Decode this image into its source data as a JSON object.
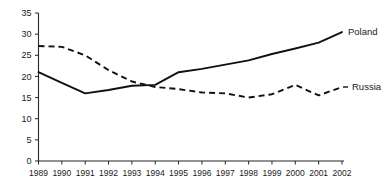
{
  "chart_data": {
    "type": "line",
    "title": "",
    "subtitle": "",
    "xlabel": "",
    "ylabel": "",
    "categories": [
      "1989",
      "1990",
      "1991",
      "1992",
      "1993",
      "1994",
      "1995",
      "1996",
      "1997",
      "1998",
      "1999",
      "2000",
      "2001",
      "2002"
    ],
    "x": [
      1989,
      1990,
      1991,
      1992,
      1993,
      1994,
      1995,
      1996,
      1997,
      1998,
      1999,
      2000,
      2001,
      2002
    ],
    "series": [
      {
        "name": "Poland",
        "style": "solid",
        "values": [
          21.0,
          18.5,
          16.0,
          16.8,
          17.8,
          18.0,
          21.0,
          21.8,
          22.8,
          23.8,
          25.3,
          26.6,
          28.0,
          30.5
        ]
      },
      {
        "name": "Russia",
        "style": "dashed",
        "values": [
          27.2,
          27.0,
          25.0,
          21.5,
          18.8,
          17.5,
          17.0,
          16.2,
          16.0,
          15.0,
          15.8,
          18.0,
          15.5,
          17.5
        ]
      }
    ],
    "ylim": [
      0,
      35
    ],
    "yticks": [
      0,
      5,
      10,
      15,
      20,
      25,
      30,
      35
    ],
    "ytick_labels": [
      "0",
      "5",
      "10",
      "15",
      "20",
      "25",
      "30",
      "35"
    ],
    "xlim": [
      1989,
      2002
    ],
    "grid": false,
    "legend_position": "right-inline",
    "annotations": [
      {
        "text": "Poland",
        "series": "Poland"
      },
      {
        "text": "Russia",
        "series": "Russia"
      }
    ],
    "colors": {
      "line": "#111111",
      "axis": "#262626",
      "background": "#ffffff"
    }
  }
}
